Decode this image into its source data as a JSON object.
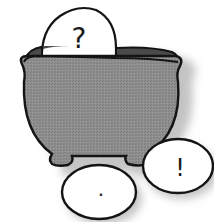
{
  "illustration": {
    "subject": "cauldron with punctuation eggs",
    "colors": {
      "background": "#ffffff",
      "pot_fill": "#8c8c8c",
      "pot_interior": "#4a4a4a",
      "outline": "#141414",
      "egg_fill": "#ffffff",
      "shadow": "#c8c8c8"
    },
    "eggs": [
      {
        "name": "question-egg",
        "symbol": "?"
      },
      {
        "name": "period-egg",
        "symbol": "."
      },
      {
        "name": "exclamation-egg",
        "symbol": "!"
      }
    ]
  }
}
